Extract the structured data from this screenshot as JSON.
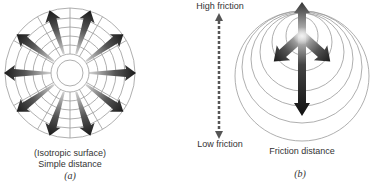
{
  "panel_a": {
    "caption_line1": "(Isotropic surface)",
    "caption_line2": "Simple distance",
    "label": "(a)",
    "arrow_count": 10,
    "ring_count": 7
  },
  "panel_b": {
    "high_label": "High friction",
    "low_label": "Low friction",
    "caption": "Friction distance",
    "label": "(b)"
  },
  "colors": {
    "arrow_dark": "#1a1a1a",
    "arrow_light": "#bdbdbd",
    "ring": "#9a9a9a",
    "dotted_axis": "#555555"
  }
}
